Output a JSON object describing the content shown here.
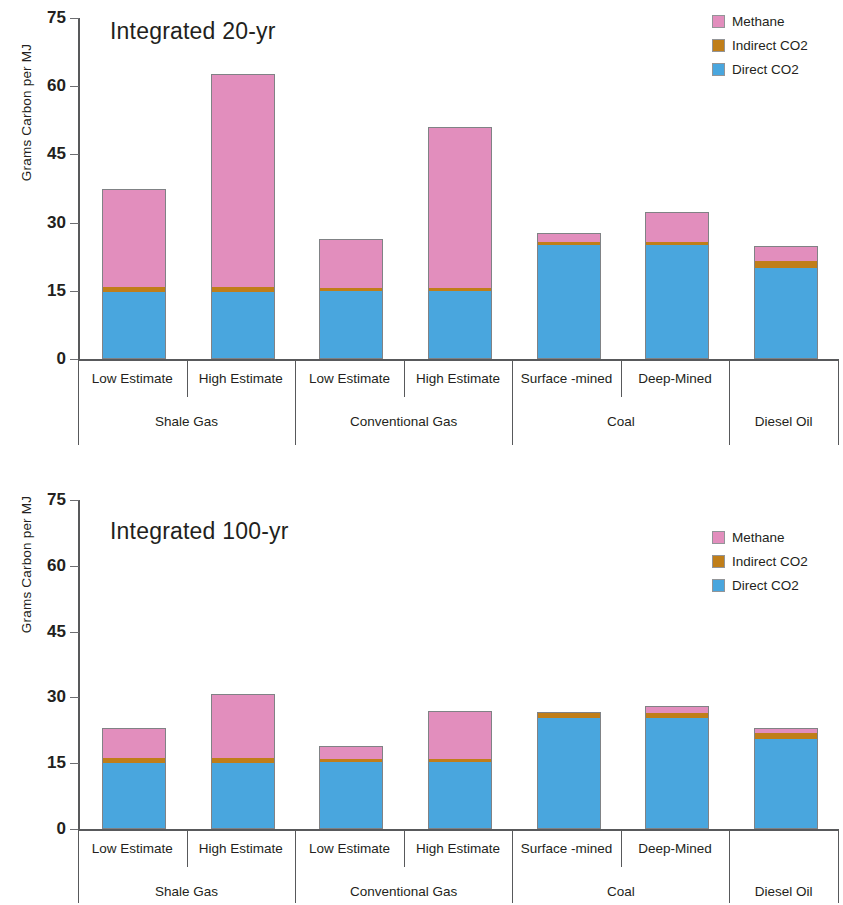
{
  "axis": {
    "ylabel": "Grams Carbon per MJ",
    "ticks": [
      0,
      15,
      30,
      45,
      60,
      75
    ],
    "ymax": 75,
    "ymin": 0
  },
  "legend": {
    "items": [
      {
        "label": "Methane",
        "color": "#e28ebd",
        "key": "methane"
      },
      {
        "label": "Indirect CO2",
        "color": "#c07e19",
        "key": "indirect"
      },
      {
        "label": "Direct CO2",
        "color": "#49a6de",
        "key": "direct"
      }
    ]
  },
  "categories": [
    {
      "group": "Shale Gas",
      "sub": "Low Estimate"
    },
    {
      "group": "Shale Gas",
      "sub": "High Estimate"
    },
    {
      "group": "Conventional Gas",
      "sub": "Low Estimate"
    },
    {
      "group": "Conventional Gas",
      "sub": "High Estimate"
    },
    {
      "group": "Coal",
      "sub": "Surface -mined"
    },
    {
      "group": "Coal",
      "sub": "Deep-Mined"
    },
    {
      "group": "Diesel Oil",
      "sub": ""
    }
  ],
  "groups": [
    {
      "label": "Shale Gas",
      "span": 2
    },
    {
      "label": "Conventional Gas",
      "span": 2
    },
    {
      "label": "Coal",
      "span": 2
    },
    {
      "label": "Diesel Oil",
      "span": 1
    }
  ],
  "panels": [
    {
      "id": "panel-20",
      "title": "Integrated 20-yr"
    },
    {
      "id": "panel-100",
      "title": "Integrated 100-yr"
    }
  ],
  "chart_data": [
    {
      "type": "bar",
      "stacked": true,
      "title": "Integrated 20-yr",
      "xlabel": "",
      "ylabel": "Grams Carbon per MJ",
      "ylim": [
        0,
        75
      ],
      "yticks": [
        0,
        15,
        30,
        45,
        60,
        75
      ],
      "grid": false,
      "legend_position": "top-right",
      "categories": [
        "Shale Gas / Low Estimate",
        "Shale Gas / High Estimate",
        "Conventional Gas / Low Estimate",
        "Conventional Gas / High Estimate",
        "Coal / Surface -mined",
        "Coal / Deep-Mined",
        "Diesel Oil"
      ],
      "series": [
        {
          "name": "Direct CO2",
          "color": "#49a6de",
          "values": [
            14.6,
            14.6,
            14.8,
            14.8,
            24.8,
            24.8,
            19.9
          ]
        },
        {
          "name": "Indirect CO2",
          "color": "#c07e19",
          "values": [
            1.1,
            1.1,
            0.7,
            0.7,
            0.8,
            0.8,
            1.4
          ]
        },
        {
          "name": "Methane",
          "color": "#e28ebd",
          "values": [
            21.3,
            46.5,
            10.5,
            35.0,
            1.7,
            6.2,
            3.1
          ]
        }
      ],
      "totals": [
        37.0,
        62.2,
        26.0,
        50.5,
        27.3,
        31.8,
        24.4
      ]
    },
    {
      "type": "bar",
      "stacked": true,
      "title": "Integrated 100-yr",
      "xlabel": "",
      "ylabel": "Grams Carbon per MJ",
      "ylim": [
        0,
        75
      ],
      "yticks": [
        0,
        15,
        30,
        45,
        60,
        75
      ],
      "grid": false,
      "legend_position": "top-right",
      "categories": [
        "Shale Gas / Low Estimate",
        "Shale Gas / High Estimate",
        "Conventional Gas / Low Estimate",
        "Conventional Gas / High Estimate",
        "Coal / Surface -mined",
        "Coal / Deep-Mined",
        "Diesel Oil"
      ],
      "series": [
        {
          "name": "Direct CO2",
          "color": "#49a6de",
          "values": [
            14.8,
            14.8,
            15.0,
            15.0,
            25.0,
            25.0,
            20.2
          ]
        },
        {
          "name": "Indirect CO2",
          "color": "#c07e19",
          "values": [
            1.2,
            1.2,
            0.8,
            0.8,
            1.2,
            1.2,
            1.5
          ]
        },
        {
          "name": "Methane",
          "color": "#e28ebd",
          "values": [
            6.6,
            14.4,
            2.7,
            10.7,
            0.0,
            1.4,
            0.8
          ]
        }
      ],
      "totals": [
        22.6,
        30.4,
        18.5,
        26.5,
        26.2,
        27.6,
        22.5
      ]
    }
  ]
}
